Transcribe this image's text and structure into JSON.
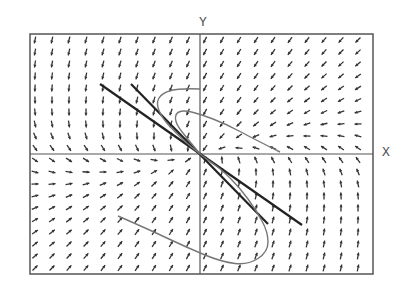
{
  "figure": {
    "type": "phase_portrait_direction_field",
    "x_axis_label": "X",
    "y_axis_label": "Y",
    "frame": {
      "left": 30,
      "top": 34,
      "right": 373,
      "bottom": 274
    },
    "origin_px": {
      "x": 200,
      "y": 154
    },
    "grid": {
      "cols": 20,
      "rows": 20,
      "x_start": 35,
      "x_step": 17,
      "y_start": 40,
      "y_step": 12
    },
    "colors": {
      "frame": "#555555",
      "arrow": "#333333",
      "eigenline": "#222222",
      "trajectory": "#777777",
      "axis_label": "#555555"
    },
    "field_matrix": [
      [
        -1,
        -2
      ],
      [
        1,
        -4
      ]
    ],
    "eigenlines": [
      {
        "name": "steep",
        "from": [
          131,
          84
        ],
        "to": [
          268,
          224
        ]
      },
      {
        "name": "shallow",
        "from": [
          100,
          84
        ],
        "to": [
          302,
          225
        ]
      }
    ],
    "trajectories": [
      {
        "name": "upper-loop-outer",
        "points": [
          [
            200,
            89
          ],
          [
            180,
            88
          ],
          [
            162,
            93
          ],
          [
            156,
            103
          ],
          [
            162,
            118
          ],
          [
            176,
            133
          ],
          [
            190,
            146
          ],
          [
            200,
            154
          ]
        ]
      },
      {
        "name": "upper-loop-inner",
        "points": [
          [
            280,
            152
          ],
          [
            252,
            138
          ],
          [
            226,
            124
          ],
          [
            200,
            114
          ],
          [
            183,
            110
          ],
          [
            175,
            114
          ],
          [
            176,
            124
          ],
          [
            186,
            137
          ],
          [
            196,
            149
          ],
          [
            200,
            154
          ]
        ]
      },
      {
        "name": "lower-loop",
        "points": [
          [
            118,
            216
          ],
          [
            150,
            230
          ],
          [
            188,
            248
          ],
          [
            222,
            262
          ],
          [
            248,
            265
          ],
          [
            268,
            252
          ],
          [
            268,
            232
          ],
          [
            256,
            210
          ],
          [
            240,
            188
          ],
          [
            222,
            170
          ],
          [
            208,
            160
          ],
          [
            200,
            154
          ]
        ]
      }
    ]
  }
}
